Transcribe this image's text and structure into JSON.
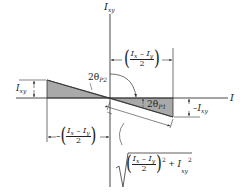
{
  "diagram": {
    "type": "mohr-circle-principal-moments",
    "axes": {
      "vertical_label": "I",
      "vertical_label_sub": "xy",
      "horizontal_label": "I"
    },
    "labels": {
      "left_height": {
        "main": "I",
        "sub": "xy"
      },
      "right_height": {
        "prefix": "–",
        "main": "I",
        "sub": "xy"
      },
      "angle_p2": {
        "prefix": "2θ",
        "sub": "P2"
      },
      "angle_p1": {
        "prefix": "2θ",
        "sub": "P1"
      },
      "top_dim": {
        "numerator": "Iₓ – Iᵧ",
        "num_a": "I",
        "num_a_sub": "x",
        "minus": " – ",
        "num_b": "I",
        "num_b_sub": "y",
        "denominator": "2"
      },
      "bottom_dim": {
        "prefix": "–",
        "num_a": "I",
        "num_a_sub": "x",
        "minus": " – ",
        "num_b": "I",
        "num_b_sub": "y",
        "denominator": "2"
      },
      "radius": {
        "num_a": "I",
        "num_a_sub": "x",
        "minus": " – ",
        "num_b": "I",
        "num_b_sub": "y",
        "denominator": "2",
        "exp": "2",
        "plus": " + ",
        "term": "I",
        "term_sub": "xy",
        "term_exp": "2"
      }
    },
    "colors": {
      "line": "#333333",
      "fill": "#a9a9a9"
    }
  }
}
